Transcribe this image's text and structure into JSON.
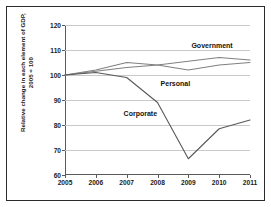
{
  "chart_data": {
    "type": "line",
    "title": "",
    "xlabel": "",
    "ylabel_line1": "Relative change in each element of GDP,",
    "ylabel_line2": "2005 = 100",
    "categories": [
      "2005",
      "2006",
      "2007",
      "2008",
      "2009",
      "2010",
      "2011"
    ],
    "x": [
      2005,
      2006,
      2007,
      2008,
      2009,
      2010,
      2011
    ],
    "ylim": [
      60,
      120
    ],
    "yticks": [
      60,
      70,
      80,
      90,
      100,
      110,
      120
    ],
    "grid": "horizontal",
    "legend_position": "inline-annotations",
    "series": [
      {
        "name": "Government",
        "color": "#808080",
        "values": [
          100,
          101.5,
          103,
          104,
          105.5,
          107,
          106
        ],
        "label_text": "Government"
      },
      {
        "name": "Personal",
        "color": "#808080",
        "values": [
          100,
          102,
          105,
          104,
          102,
          104,
          105
        ],
        "label_text": "Personal"
      },
      {
        "name": "Corporate",
        "color": "#595959",
        "values": [
          100,
          101,
          99,
          89,
          66.5,
          78.5,
          82
        ],
        "label_text": "Corporate"
      }
    ],
    "annotations": [
      {
        "text": "Government",
        "x": 2009.1,
        "y": 111.5
      },
      {
        "text": "Personal",
        "x": 2008.1,
        "y": 96.5
      },
      {
        "text": "Corporate",
        "x": 2006.9,
        "y": 84.5
      }
    ]
  }
}
